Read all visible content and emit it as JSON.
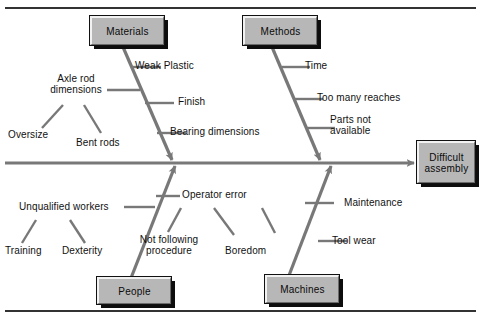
{
  "diagram": {
    "type": "fishbone-ishikawa-cause-and-effect",
    "effect": {
      "line1": "Difficult",
      "line2": "assembly"
    },
    "categories": [
      {
        "name": "Materials",
        "label": "Materials",
        "position": "top-left",
        "causes": [
          {
            "label": "Weak Plastic"
          },
          {
            "label": "Finish"
          },
          {
            "label": "Bearing dimensions"
          },
          {
            "line1": "Axle rod",
            "line2": "dimensions",
            "label": "Axle rod dimensions",
            "subcauses": [
              {
                "label": "Oversize"
              },
              {
                "label": "Bent rods"
              }
            ]
          }
        ]
      },
      {
        "name": "Methods",
        "label": "Methods",
        "position": "top-right",
        "causes": [
          {
            "label": "Time"
          },
          {
            "label": "Too many reaches"
          },
          {
            "line1": "Parts not",
            "line2": "available",
            "label": "Parts not available"
          }
        ]
      },
      {
        "name": "People",
        "label": "People",
        "position": "bottom-left",
        "causes": [
          {
            "label": "Unqualified workers",
            "subcauses": [
              {
                "label": "Training"
              },
              {
                "label": "Dexterity"
              }
            ]
          },
          {
            "label": "Operator error",
            "subcauses": [
              {
                "line1": "Not following",
                "line2": "procedure",
                "label": "Not following procedure"
              },
              {
                "label": "Boredom"
              }
            ]
          }
        ]
      },
      {
        "name": "Machines",
        "label": "Machines",
        "position": "bottom-right",
        "causes": [
          {
            "label": "Maintenance"
          },
          {
            "label": "Tool wear"
          }
        ]
      }
    ]
  },
  "colors": {
    "box_fill": "#b7b7b7",
    "box_shadow": "#0d0d0d",
    "box_highlight": "#f2f2f2",
    "line": "#787878",
    "spine": "#787878",
    "text": "#111111",
    "frame": "#333333",
    "background": "#ffffff"
  }
}
